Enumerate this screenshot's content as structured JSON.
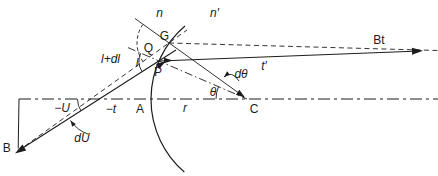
{
  "figure": {
    "background": "#ffffff",
    "ink": "#1d1d1d",
    "labels": {
      "medium_left_index": "n",
      "medium_right_index": "n′",
      "point_G": "G",
      "point_Q": "Q",
      "point_P": "P",
      "angle_incidence": "l",
      "angle_incidence_plus_dl": "l+dl",
      "image_point": "Bt",
      "image_distance": "t′",
      "angle_d_theta": "dθ",
      "angle_theta": "θ",
      "vertex_A": "A",
      "radius_r": "r",
      "center_C": "C",
      "object_distance": "−t",
      "angle_minus_U": "−U",
      "angle_dU": "dU",
      "object_point_B": "B"
    }
  }
}
